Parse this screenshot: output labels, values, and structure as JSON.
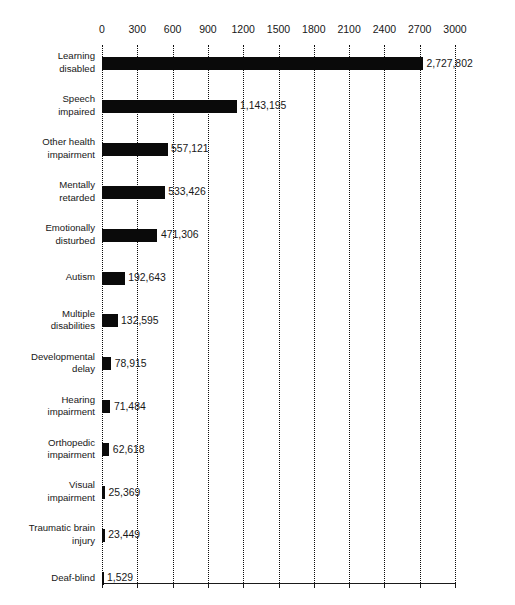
{
  "chart_data": {
    "type": "bar",
    "orientation": "horizontal",
    "title": "",
    "xlabel": "",
    "ylabel": "",
    "xlim": [
      0,
      3000
    ],
    "grid": true,
    "legend": null,
    "value_units": "thousands",
    "xticks": [
      "0",
      "300",
      "600",
      "900",
      "1200",
      "1500",
      "1800",
      "2100",
      "2400",
      "2700",
      "3000"
    ],
    "xtick_values": [
      0,
      300,
      600,
      900,
      1200,
      1500,
      1800,
      2100,
      2400,
      2700,
      3000
    ],
    "categories": [
      "Learning\ndisabled",
      "Speech\nimpaired",
      "Other health\nimpairment",
      "Mentally\nretarded",
      "Emotionally\ndisturbed",
      "Autism",
      "Multiple\ndisabilities",
      "Developmental\ndelay",
      "Hearing\nimpairment",
      "Orthopedic\nimpairment",
      "Visual\nimpairment",
      "Traumatic brain\ninjury",
      "Deaf-blind"
    ],
    "values": [
      2727802,
      1143195,
      557121,
      533426,
      471306,
      192643,
      132595,
      78915,
      71484,
      62618,
      25369,
      23449,
      1529
    ],
    "value_labels": [
      "2,727,802",
      "1,143,195",
      "557,121",
      "533,426",
      "471,306",
      "192,643",
      "132,595",
      "78,915",
      "71,484",
      "62,618",
      "25,369",
      "23,449",
      "1,529"
    ],
    "bar_color": "#0a0a0a",
    "gridline_color": "#0d0d0d",
    "axis_color": "#1a1a1a"
  },
  "top_remnant": "",
  "chart_name": "students-served-by-disability-bar-chart"
}
